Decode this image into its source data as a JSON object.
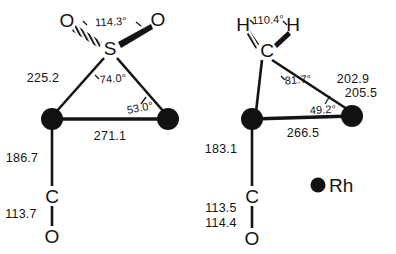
{
  "figure": {
    "caption_present": false,
    "units_note": null,
    "ink_color": "#141414",
    "atom_color": "#111111"
  },
  "legend": {
    "symbol": "filled-circle",
    "label": "Rh"
  },
  "structures": [
    {
      "id": "left",
      "name": "sulfur-dioxide-bridged-dirhodium",
      "bridging_group": "SO2",
      "atoms": [
        {
          "key": "O_left",
          "label": "O",
          "x": 67,
          "y": 20
        },
        {
          "key": "O_right",
          "label": "O",
          "x": 158,
          "y": 19
        },
        {
          "key": "S",
          "label": "S",
          "x": 110,
          "y": 48
        },
        {
          "key": "Rh_left",
          "label": "",
          "x": 52,
          "y": 119
        },
        {
          "key": "Rh_right",
          "label": "",
          "x": 168,
          "y": 119
        },
        {
          "key": "C",
          "label": "C",
          "x": 52,
          "y": 196
        },
        {
          "key": "O_co",
          "label": "O",
          "x": 52,
          "y": 236
        }
      ],
      "distances": [
        {
          "key": "S_Rh",
          "value": "225.2",
          "x": 43,
          "y": 78
        },
        {
          "key": "Rh_Rh",
          "value": "271.1",
          "x": 110,
          "y": 136
        },
        {
          "key": "Rh_C",
          "value": "186.7",
          "x": 22,
          "y": 158
        },
        {
          "key": "C_O",
          "value": "113.7",
          "x": 21,
          "y": 214
        }
      ],
      "angles": [
        {
          "key": "O_S_O",
          "value": "114.3°",
          "x": 111,
          "y": 22
        },
        {
          "key": "Rh_S_Rh",
          "value": "74.0°",
          "x": 113,
          "y": 79
        },
        {
          "key": "S_Rh_Rh",
          "value": "53.0°",
          "x": 140,
          "y": 108
        }
      ]
    },
    {
      "id": "right",
      "name": "methylene-bridged-dirhodium",
      "bridging_group": "CH2",
      "atoms": [
        {
          "key": "H_left",
          "label": "H",
          "x": 243,
          "y": 24
        },
        {
          "key": "H_right",
          "label": "H",
          "x": 293,
          "y": 24
        },
        {
          "key": "C_bridge",
          "label": "C",
          "x": 267,
          "y": 50
        },
        {
          "key": "Rh_left",
          "label": "",
          "x": 252,
          "y": 119
        },
        {
          "key": "Rh_right",
          "label": "",
          "x": 352,
          "y": 116
        },
        {
          "key": "C",
          "label": "C",
          "x": 252,
          "y": 196
        },
        {
          "key": "O_co",
          "label": "O",
          "x": 252,
          "y": 238
        }
      ],
      "distances": [
        {
          "key": "C_Rh_1",
          "value": "202.9",
          "x": 353,
          "y": 79
        },
        {
          "key": "C_Rh_2",
          "value": "205.5",
          "x": 361,
          "y": 93
        },
        {
          "key": "Rh_Rh",
          "value": "266.5",
          "x": 303,
          "y": 133
        },
        {
          "key": "Rh_C",
          "value": "183.1",
          "x": 221,
          "y": 149
        },
        {
          "key": "C_O_1",
          "value": "113.5",
          "x": 221,
          "y": 208
        },
        {
          "key": "C_O_2",
          "value": "114.4",
          "x": 221,
          "y": 223
        }
      ],
      "angles": [
        {
          "key": "H_C_H",
          "value": "110.4°",
          "x": 268,
          "y": 20
        },
        {
          "key": "Rh_C_Rh",
          "value": "81.7°",
          "x": 298,
          "y": 80
        },
        {
          "key": "C_Rh_Rh",
          "value": "49.2°",
          "x": 323,
          "y": 110
        }
      ]
    }
  ]
}
